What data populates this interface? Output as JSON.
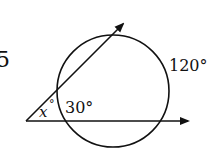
{
  "problem_number": "5",
  "labels": {
    "unknown_angle": "x",
    "degree": "°",
    "inner_arc": "30°",
    "outer_arc": "120°"
  },
  "geometry": {
    "circle": {
      "cx": 113,
      "cy": 91,
      "r": 56
    },
    "vertex": {
      "x": 26,
      "y": 121
    },
    "ray_horizontal_end": {
      "x": 190,
      "y": 121
    },
    "ray_diagonal_end": {
      "x": 125,
      "y": 22
    },
    "stroke_color": "#111111"
  }
}
